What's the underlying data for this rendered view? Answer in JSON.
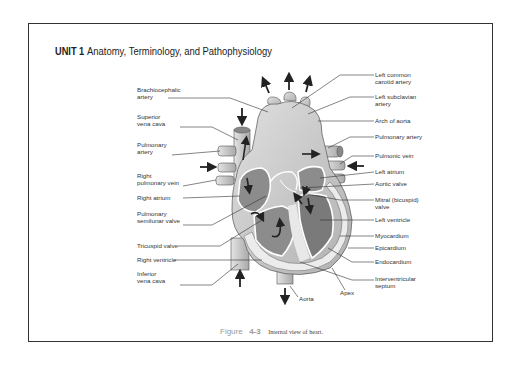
{
  "header": {
    "unit": "UNIT 1",
    "title": "Anatomy, Terminology, and Pathophysiology"
  },
  "figure": {
    "label": "Figure",
    "number": "4-3",
    "caption": "Internal view of heart."
  },
  "labels": {
    "left": [
      {
        "id": "brachiocephalic",
        "lines": [
          "Brachiocephalic",
          "artery"
        ]
      },
      {
        "id": "superior-vena-cava",
        "lines": [
          "Superior",
          "vena cava"
        ]
      },
      {
        "id": "pulmonary-artery-left",
        "lines": [
          "Pulmonary",
          "artery"
        ]
      },
      {
        "id": "right-pulmonary-vein",
        "lines": [
          "Right",
          "pulmonary vein"
        ]
      },
      {
        "id": "right-atrium",
        "lines": [
          "Right atrium"
        ]
      },
      {
        "id": "pulmonary-semilunar-valve",
        "lines": [
          "Pulmonary",
          "semilunar valve"
        ]
      },
      {
        "id": "tricuspid-valve",
        "lines": [
          "Tricuspid valve"
        ]
      },
      {
        "id": "right-ventricle",
        "lines": [
          "Right ventricle"
        ]
      },
      {
        "id": "inferior-vena-cava",
        "lines": [
          "Inferior",
          "vena cava"
        ]
      }
    ],
    "right": [
      {
        "id": "left-common-carotid",
        "lines": [
          "Left common",
          "carotid artery"
        ]
      },
      {
        "id": "left-subclavian",
        "lines": [
          "Left subclavian",
          "artery"
        ]
      },
      {
        "id": "arch-of-aorta",
        "lines": [
          "Arch of aorta"
        ]
      },
      {
        "id": "pulmonary-artery-right",
        "lines": [
          "Pulmonary artery"
        ]
      },
      {
        "id": "pulmonic-vein",
        "lines": [
          "Pulmonic vein"
        ]
      },
      {
        "id": "left-atrium",
        "lines": [
          "Left atrium"
        ]
      },
      {
        "id": "aortic-valve",
        "lines": [
          "Aortic valve"
        ]
      },
      {
        "id": "mitral-valve",
        "lines": [
          "Mitral (bicuspid)",
          "valve"
        ]
      },
      {
        "id": "left-ventricle",
        "lines": [
          "Left ventricle"
        ]
      },
      {
        "id": "myocardium",
        "lines": [
          "Myocardium"
        ]
      },
      {
        "id": "epicardium",
        "lines": [
          "Epicardium"
        ]
      },
      {
        "id": "endocardium",
        "lines": [
          "Endocardium"
        ]
      },
      {
        "id": "interventricular-septum",
        "lines": [
          "Interventricular",
          "septum"
        ]
      }
    ],
    "bottom": [
      {
        "id": "aorta",
        "lines": [
          "Aorta"
        ]
      },
      {
        "id": "apex",
        "lines": [
          "Apex"
        ]
      }
    ]
  },
  "colors": {
    "frame": "#333333",
    "heart_fill": "#c8c8c8",
    "chamber_fill": "#8c8c8c",
    "wall_fill": "#e6e6e6",
    "arrow": "#222222",
    "caption_gray": "#999999"
  }
}
